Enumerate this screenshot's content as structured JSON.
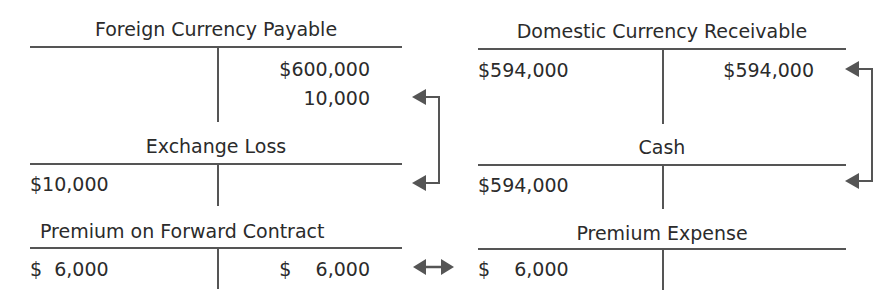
{
  "accounts": {
    "foreign_currency_payable": {
      "title": "Foreign Currency Payable",
      "debit": [],
      "credit": [
        "$600,000",
        "10,000"
      ]
    },
    "domestic_currency_receivable": {
      "title": "Domestic Currency Receivable",
      "debit": [
        "$594,000"
      ],
      "credit": [
        "$594,000"
      ]
    },
    "exchange_loss": {
      "title": "Exchange Loss",
      "debit": [
        "$10,000"
      ],
      "credit": []
    },
    "cash": {
      "title": "Cash",
      "debit": [
        "$594,000"
      ],
      "credit": []
    },
    "premium_on_forward_contract": {
      "title": "Premium on Forward Contract",
      "debit": [
        "$  6,000"
      ],
      "credit": [
        "$    6,000"
      ]
    },
    "premium_expense": {
      "title": "Premium Expense",
      "debit": [
        "$    6,000"
      ],
      "credit": []
    }
  },
  "arrows": [
    {
      "from": "foreign_currency_payable.credit.1",
      "to": "exchange_loss.debit.0",
      "type": "bracket-arrow"
    },
    {
      "from": "domestic_currency_receivable.credit.0",
      "to": "cash.debit.0",
      "type": "bracket-arrow"
    },
    {
      "from": "premium_on_forward_contract.credit.0",
      "to": "premium_expense.debit.0",
      "type": "double-arrow"
    }
  ],
  "colors": {
    "line": "#555555",
    "text": "#2b2b2b",
    "arrow": "#555555"
  }
}
